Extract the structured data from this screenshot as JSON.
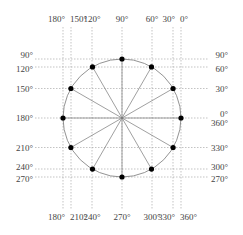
{
  "diagram": {
    "type": "unit-circle-angle-projection",
    "center": [
      122,
      118
    ],
    "radius": 59,
    "angles_deg": [
      0,
      30,
      60,
      90,
      120,
      150,
      180,
      210,
      240,
      270,
      300,
      330
    ],
    "top_labels": [
      {
        "text": "180°",
        "x": 63
      },
      {
        "text": "150°",
        "x": 71
      },
      {
        "text": "120°",
        "x": 92
      },
      {
        "text": "90°",
        "x": 122
      },
      {
        "text": "60°",
        "x": 152
      },
      {
        "text": "30°",
        "x": 173
      },
      {
        "text": "0°",
        "x": 181
      }
    ],
    "bottom_labels": [
      {
        "text": "180°",
        "x": 63
      },
      {
        "text": "210°",
        "x": 71
      },
      {
        "text": "240°",
        "x": 92
      },
      {
        "text": "270°",
        "x": 122
      },
      {
        "text": "300°",
        "x": 152
      },
      {
        "text": "330°",
        "x": 173
      },
      {
        "text": "360°",
        "x": 181
      }
    ],
    "left_labels": [
      {
        "text": "90°",
        "y": 59
      },
      {
        "text": "120°",
        "y": 67
      },
      {
        "text": "150°",
        "y": 88.5
      },
      {
        "text": "180°",
        "y": 118
      },
      {
        "text": "210°",
        "y": 147.5
      },
      {
        "text": "240°",
        "y": 169
      },
      {
        "text": "270°",
        "y": 177
      }
    ],
    "right_labels": [
      {
        "text": "90°",
        "y": 59
      },
      {
        "text": "60°",
        "y": 67
      },
      {
        "text": "30°",
        "y": 88.5
      },
      {
        "text": "0°",
        "y": 114
      },
      {
        "text": "360°",
        "y": 123
      },
      {
        "text": "330°",
        "y": 147.5
      },
      {
        "text": "300°",
        "y": 169
      },
      {
        "text": "270°",
        "y": 177
      }
    ],
    "colors": {
      "dot": "#000000",
      "circle": "#777777",
      "guide": "#9a9a9a",
      "label": "#444444"
    }
  }
}
